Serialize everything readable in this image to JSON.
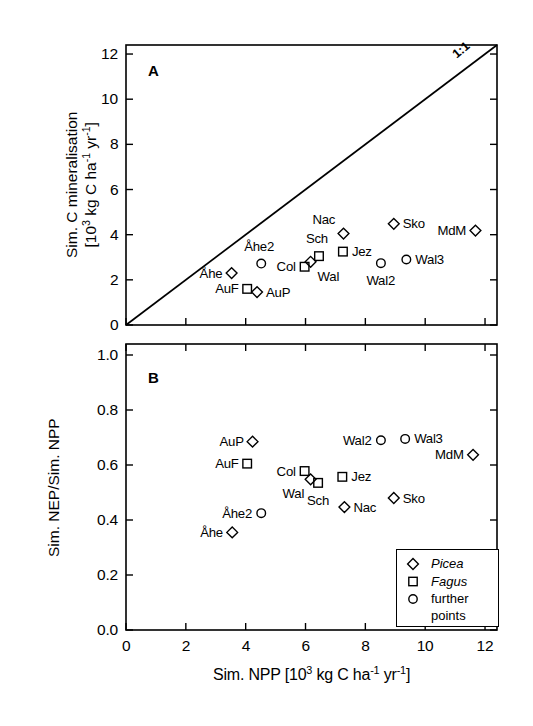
{
  "figure": {
    "xaxis": {
      "label_main": "Sim. NPP [10",
      "label_sup1": "3",
      "label_mid": " kg C ha",
      "label_sup2": "-1",
      "label_mid2": " yr",
      "label_sup3": "-1",
      "label_end": "]",
      "ticks": [
        "0",
        "2",
        "4",
        "6",
        "8",
        "10",
        "12"
      ],
      "tickvals": [
        0,
        2,
        4,
        6,
        8,
        10,
        12
      ],
      "range": [
        0,
        12.4
      ]
    },
    "panelA": {
      "letter": "A",
      "ytitle_line1": "Sim. C mineralisation",
      "ytitle_line2_a": "[10",
      "ytitle_line2_sup1": "3",
      "ytitle_line2_b": " kg C ha",
      "ytitle_line2_sup2": "-1",
      "ytitle_line2_c": " yr",
      "ytitle_line2_sup3": "-1",
      "ytitle_line2_d": "]",
      "yticks": [
        "0",
        "2",
        "4",
        "6",
        "8",
        "10",
        "12"
      ],
      "ytickvals": [
        0,
        2,
        4,
        6,
        8,
        10,
        12
      ],
      "yrange": [
        0,
        12.4
      ],
      "line_label": "1:1"
    },
    "panelB": {
      "letter": "B",
      "ytitle": "Sim. NEP/Sim. NPP",
      "yticks": [
        "0.0",
        "0.2",
        "0.4",
        "0.6",
        "0.8",
        "1.0"
      ],
      "ytickvals": [
        0.0,
        0.2,
        0.4,
        0.6,
        0.8,
        1.0
      ],
      "yrange": [
        0,
        1.04
      ]
    },
    "legend": {
      "items": [
        {
          "marker": "diamond",
          "label": "Picea",
          "italic": true
        },
        {
          "marker": "square",
          "label": "Fagus",
          "italic": true
        },
        {
          "marker": "circle",
          "label": "further",
          "label2": "points",
          "italic": false
        }
      ]
    }
  },
  "chart_data": [
    {
      "type": "scatter",
      "panel": "A",
      "title": "A",
      "xlabel": "Sim. NPP [10^3 kg C ha^-1 yr^-1]",
      "ylabel": "Sim. C mineralisation [10^3 kg C ha^-1 yr^-1]",
      "xlim": [
        0,
        12.4
      ],
      "ylim": [
        0,
        12.4
      ],
      "grid": false,
      "reference_line": {
        "label": "1:1",
        "from": [
          0,
          0
        ],
        "to": [
          12.4,
          12.4
        ]
      },
      "points": [
        {
          "name": "Åhe",
          "marker": "diamond",
          "x": 3.53,
          "y": 2.3,
          "label_pos": "left"
        },
        {
          "name": "Åhe2",
          "marker": "circle",
          "x": 4.52,
          "y": 2.72,
          "label_pos": "above"
        },
        {
          "name": "AuF",
          "marker": "square",
          "x": 4.05,
          "y": 1.6,
          "label_pos": "left"
        },
        {
          "name": "AuP",
          "marker": "diamond",
          "x": 4.38,
          "y": 1.46,
          "label_pos": "right"
        },
        {
          "name": "Col",
          "marker": "square",
          "x": 5.97,
          "y": 2.58,
          "label_pos": "left"
        },
        {
          "name": "Wal",
          "marker": "diamond",
          "x": 6.17,
          "y": 2.8,
          "label_pos": "belowright"
        },
        {
          "name": "Sch",
          "marker": "square",
          "x": 6.45,
          "y": 3.05,
          "label_pos": "above"
        },
        {
          "name": "Jez",
          "marker": "square",
          "x": 7.25,
          "y": 3.25,
          "label_pos": "right"
        },
        {
          "name": "Nac",
          "marker": "diamond",
          "x": 7.27,
          "y": 4.05,
          "label_pos": "upleft"
        },
        {
          "name": "Wal2",
          "marker": "circle",
          "x": 8.52,
          "y": 2.74,
          "label_pos": "below"
        },
        {
          "name": "Sko",
          "marker": "diamond",
          "x": 8.95,
          "y": 4.48,
          "label_pos": "right"
        },
        {
          "name": "Wal3",
          "marker": "circle",
          "x": 9.37,
          "y": 2.9,
          "label_pos": "right"
        },
        {
          "name": "MdM",
          "marker": "diamond",
          "x": 11.68,
          "y": 4.18,
          "label_pos": "left"
        }
      ]
    },
    {
      "type": "scatter",
      "panel": "B",
      "title": "B",
      "xlabel": "Sim. NPP [10^3 kg C ha^-1 yr^-1]",
      "ylabel": "Sim. NEP/Sim. NPP",
      "xlim": [
        0,
        12.4
      ],
      "ylim": [
        0,
        1.04
      ],
      "grid": false,
      "points": [
        {
          "name": "Åhe",
          "marker": "diamond",
          "x": 3.55,
          "y": 0.355,
          "label_pos": "left"
        },
        {
          "name": "Åhe2",
          "marker": "circle",
          "x": 4.52,
          "y": 0.425,
          "label_pos": "left"
        },
        {
          "name": "AuP",
          "marker": "diamond",
          "x": 4.23,
          "y": 0.685,
          "label_pos": "left"
        },
        {
          "name": "AuF",
          "marker": "square",
          "x": 4.05,
          "y": 0.605,
          "label_pos": "left"
        },
        {
          "name": "Col",
          "marker": "square",
          "x": 5.97,
          "y": 0.578,
          "label_pos": "left"
        },
        {
          "name": "Wal",
          "marker": "diamond",
          "x": 6.17,
          "y": 0.548,
          "label_pos": "belowleft"
        },
        {
          "name": "Sch",
          "marker": "square",
          "x": 6.42,
          "y": 0.535,
          "label_pos": "below"
        },
        {
          "name": "Jez",
          "marker": "square",
          "x": 7.23,
          "y": 0.557,
          "label_pos": "right"
        },
        {
          "name": "Nac",
          "marker": "diamond",
          "x": 7.3,
          "y": 0.447,
          "label_pos": "right"
        },
        {
          "name": "Wal2",
          "marker": "circle",
          "x": 8.52,
          "y": 0.69,
          "label_pos": "left"
        },
        {
          "name": "Sko",
          "marker": "diamond",
          "x": 8.95,
          "y": 0.48,
          "label_pos": "right"
        },
        {
          "name": "Wal3",
          "marker": "circle",
          "x": 9.33,
          "y": 0.695,
          "label_pos": "right"
        },
        {
          "name": "MdM",
          "marker": "diamond",
          "x": 11.6,
          "y": 0.637,
          "label_pos": "left"
        }
      ]
    }
  ]
}
